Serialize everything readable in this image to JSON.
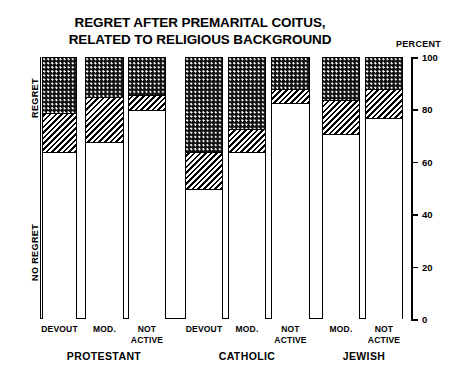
{
  "title": {
    "line1": "REGRET AFTER PREMARITAL COITUS,",
    "line2": "RELATED TO RELIGIOUS BACKGROUND"
  },
  "axis": {
    "percent_caption": "PERCENT",
    "y_ticks": [
      "100",
      "80",
      "60",
      "40",
      "20",
      "0"
    ]
  },
  "side_labels": {
    "regret": "REGRET",
    "no_regret": "NO REGRET"
  },
  "groups": [
    {
      "name": "PROTESTANT",
      "bars": [
        "DEVOUT",
        "MOD.",
        "NOT ACTIVE"
      ]
    },
    {
      "name": "CATHOLIC",
      "bars": [
        "DEVOUT",
        "MOD.",
        "NOT ACTIVE"
      ]
    },
    {
      "name": "JEWISH",
      "bars": [
        "MOD.",
        "NOT ACTIVE"
      ]
    }
  ],
  "chart_data": {
    "type": "bar",
    "title": "REGRET AFTER PREMARITAL COITUS, RELATED TO RELIGIOUS BACKGROUND",
    "xlabel": "",
    "ylabel": "PERCENT",
    "ylim": [
      0,
      100
    ],
    "yticks": [
      0,
      20,
      40,
      60,
      80,
      100
    ],
    "grid": false,
    "legend": "none",
    "stacked": true,
    "stack_order_bottom_to_top": [
      "NO REGRET",
      "SOME REGRET",
      "REGRET"
    ],
    "series": [
      {
        "name": "NO REGRET",
        "pattern": "white",
        "values": [
          64,
          68,
          80,
          50,
          64,
          83,
          71,
          77
        ]
      },
      {
        "name": "SOME REGRET",
        "pattern": "hatched",
        "values": [
          15,
          17,
          6,
          14,
          9,
          5,
          13,
          11
        ]
      },
      {
        "name": "REGRET",
        "pattern": "dotted",
        "values": [
          21,
          15,
          14,
          36,
          27,
          12,
          16,
          12
        ]
      }
    ],
    "categories": [
      "PROTESTANT DEVOUT",
      "PROTESTANT MOD.",
      "PROTESTANT NOT ACTIVE",
      "CATHOLIC DEVOUT",
      "CATHOLIC MOD.",
      "CATHOLIC NOT ACTIVE",
      "JEWISH MOD.",
      "JEWISH NOT ACTIVE"
    ]
  },
  "bars": [
    {
      "id": "protestant-devout",
      "label_line1": "DEVOUT",
      "label_line2": "",
      "white": 64,
      "hatched": 15,
      "dotted": 21
    },
    {
      "id": "protestant-mod",
      "label_line1": "MOD.",
      "label_line2": "",
      "white": 68,
      "hatched": 17,
      "dotted": 15
    },
    {
      "id": "protestant-not-active",
      "label_line1": "NOT",
      "label_line2": "ACTIVE",
      "white": 80,
      "hatched": 6,
      "dotted": 14
    },
    {
      "id": "catholic-devout",
      "label_line1": "DEVOUT",
      "label_line2": "",
      "white": 50,
      "hatched": 14,
      "dotted": 36
    },
    {
      "id": "catholic-mod",
      "label_line1": "MOD.",
      "label_line2": "",
      "white": 64,
      "hatched": 9,
      "dotted": 27
    },
    {
      "id": "catholic-not-active",
      "label_line1": "NOT",
      "label_line2": "ACTIVE",
      "white": 83,
      "hatched": 5,
      "dotted": 12
    },
    {
      "id": "jewish-mod",
      "label_line1": "MOD.",
      "label_line2": "",
      "white": 71,
      "hatched": 13,
      "dotted": 16
    },
    {
      "id": "jewish-not-active",
      "label_line1": "NOT",
      "label_line2": "ACTIVE",
      "white": 77,
      "hatched": 11,
      "dotted": 12
    }
  ]
}
